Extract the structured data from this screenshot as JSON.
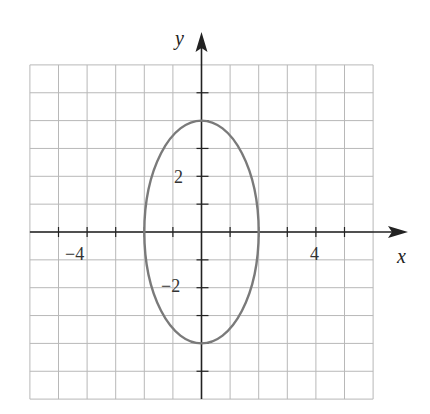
{
  "chart_data": {
    "type": "line",
    "title": "",
    "xlabel": "x",
    "ylabel": "y",
    "xlim": [
      -6,
      6
    ],
    "ylim": [
      -6,
      6
    ],
    "grid": true,
    "x_tick_labels": [
      {
        "value": -4,
        "label": "−4"
      },
      {
        "value": 4,
        "label": "4"
      }
    ],
    "y_tick_labels": [
      {
        "value": 2,
        "label": "2"
      },
      {
        "value": -2,
        "label": "−2"
      }
    ],
    "series": [
      {
        "name": "ellipse",
        "shape": "ellipse",
        "center": [
          0,
          0
        ],
        "semi_axis_x": 2,
        "semi_axis_y": 4,
        "equation": "x^2/4 + y^2/16 = 1",
        "color": "#7a7a7a"
      }
    ]
  },
  "labels": {
    "x_axis": "x",
    "y_axis": "y",
    "tick_x_neg4": "−4",
    "tick_x_4": "4",
    "tick_y_2": "2",
    "tick_y_neg2": "−2"
  },
  "colors": {
    "grid": "#b8b8b8",
    "axis": "#222222",
    "curve": "#7a7a7a"
  }
}
